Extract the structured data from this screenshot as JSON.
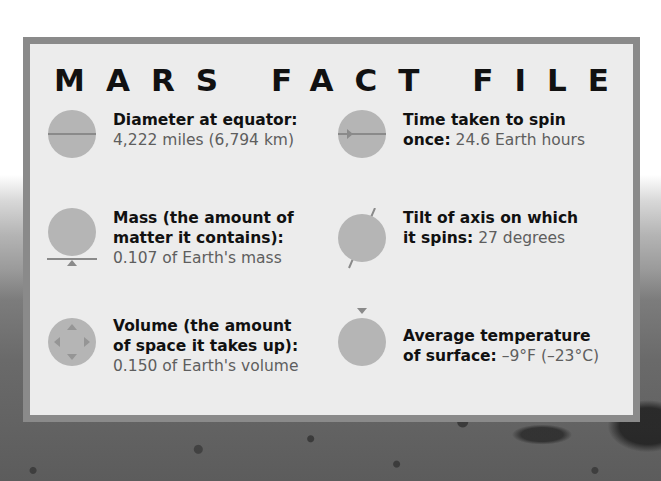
{
  "title": "MARS FACT FILE",
  "colors": {
    "card_background": "#ececec",
    "card_border": "#8a8a8a",
    "icon_fill": "#b5b5b5",
    "icon_line": "#8a8a8a",
    "label_text": "#111111",
    "value_text": "#5e5e5e"
  },
  "facts": [
    {
      "icon": "diameter-icon",
      "label": "Diameter at equator:",
      "label_line2": "",
      "value": "4,222 miles (6,794 km)"
    },
    {
      "icon": "rotation-icon",
      "label": "Time taken to spin",
      "label_line2": "once:",
      "value": "24.6 Earth hours"
    },
    {
      "icon": "mass-scale-icon",
      "label": "Mass (the amount of",
      "label_line2": "matter it contains):",
      "value": "0.107 of Earth's mass"
    },
    {
      "icon": "axis-tilt-icon",
      "label": "Tilt of axis on which",
      "label_line2": "it spins:",
      "value": "27 degrees"
    },
    {
      "icon": "volume-icon",
      "label": "Volume (the amount",
      "label_line2": "of space it takes up):",
      "value": "0.150 of Earth's volume"
    },
    {
      "icon": "temperature-icon",
      "label": "Average temperature",
      "label_line2": "of surface:",
      "value": "–9°F (–23°C)"
    }
  ]
}
